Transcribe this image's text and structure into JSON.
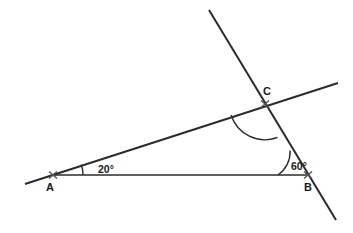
{
  "figure": {
    "kind": "geometry-diagram",
    "background_color": "#ffffff",
    "stroke_color": "#2b2b2b",
    "text_color": "#1a1a1a"
  },
  "points": {
    "a": {
      "label": "A",
      "x": 53,
      "y": 175,
      "label_x": 46,
      "label_y": 188
    },
    "b": {
      "label": "B",
      "x": 308,
      "y": 175,
      "label_x": 304,
      "label_y": 188
    },
    "c": {
      "label": "C",
      "x": 265,
      "y": 104,
      "label_x": 263,
      "label_y": 92
    }
  },
  "angles": {
    "at_a": {
      "label": "20°",
      "value": 20,
      "label_x": 98,
      "label_y": 170
    },
    "at_b": {
      "label": "60°",
      "value": 60,
      "label_x": 291,
      "label_y": 167
    },
    "at_c": {
      "label": "",
      "value": 100,
      "label_x": 0,
      "label_y": 0
    }
  },
  "segments": {
    "line_ac_extended": {
      "name": "transversal-through-a-and-c",
      "x1": 25,
      "y1": 184,
      "x2": 338,
      "y2": 83
    },
    "line_cb_extended": {
      "name": "transversal-through-c-and-b",
      "x1": 209,
      "y1": 10,
      "x2": 336,
      "y2": 220
    },
    "base_ab": {
      "name": "base-segment-a-to-b",
      "x1": 53,
      "y1": 175,
      "x2": 308,
      "y2": 175
    }
  },
  "arcs": {
    "arc_a": {
      "d": "M 83 174.8 A 30 30 0 0 0 81.25 164.8"
    },
    "arc_b": {
      "d": "M 278 175 A 30 30 0 0 0 290.2 150.5"
    },
    "arc_c": {
      "d": "M 231.1 115 A 35.5 35.5 0 0 0 277.4 137.5"
    }
  },
  "ticks": {
    "tick_a": {
      "d": "M 49 171.5 L 57 178.5 M 57 171.5 L 49 178.5"
    },
    "tick_b": {
      "d": "M 304 171.5 L 312 178.5 M 312 171.5 L 304 178.5"
    },
    "tick_c": {
      "d": "M 261 100.5 L 269 107.5 M 269 100.5 L 261 107.5"
    }
  }
}
